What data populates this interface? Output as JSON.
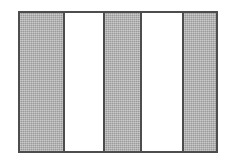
{
  "figure": {
    "kind": "striped-rectangle-diagram",
    "canvas": {
      "width": 225,
      "height": 164,
      "background": "#ffffff"
    },
    "frame": {
      "left": 18,
      "top": 11,
      "width": 200,
      "height": 142,
      "border_color": "#4d4d4d",
      "border_width": 2,
      "fill": "#ffffff"
    },
    "colors": {
      "shaded": "#adadad",
      "unshaded": "#ffffff",
      "outline": "#4d4d4d"
    },
    "stripe_count": 5,
    "stripes": [
      {
        "index": 1,
        "fill": "shaded",
        "color": "#adadad",
        "left": 0,
        "width": 43
      },
      {
        "index": 2,
        "fill": "unshaded",
        "color": "#ffffff",
        "left": 45,
        "width": 38
      },
      {
        "index": 3,
        "fill": "shaded",
        "color": "#adadad",
        "left": 85,
        "width": 35
      },
      {
        "index": 4,
        "fill": "unshaded",
        "color": "#ffffff",
        "left": 122,
        "width": 40
      },
      {
        "index": 5,
        "fill": "shaded",
        "color": "#adadad",
        "left": 164,
        "width": 32
      }
    ],
    "dividers": [
      {
        "index": 1,
        "left": 43
      },
      {
        "index": 2,
        "left": 83
      },
      {
        "index": 3,
        "left": 120
      },
      {
        "index": 4,
        "left": 162
      }
    ]
  }
}
